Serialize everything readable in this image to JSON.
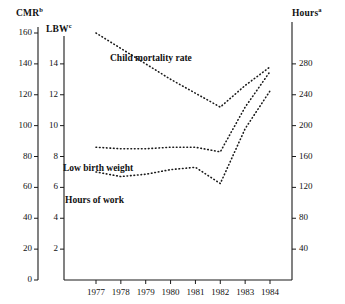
{
  "chart_data": {
    "type": "line",
    "title": "",
    "xlabel": "",
    "x": [
      1977,
      1978,
      1979,
      1980,
      1981,
      1982,
      1983,
      1984
    ],
    "xtick_labels": [
      "1977",
      "1978",
      "1979",
      "1980",
      "1981",
      "1982",
      "1983",
      "1984"
    ],
    "grid": false,
    "legend_position": "inline-annotations",
    "axes": {
      "cmr": {
        "label": "CMR",
        "label_superscript": "b",
        "ticks": [
          0,
          20,
          40,
          60,
          80,
          100,
          120,
          140,
          160
        ],
        "tick_labels": [
          "0",
          "20",
          "40",
          "60",
          "80",
          "100",
          "120",
          "140",
          "160"
        ],
        "ylim": [
          0,
          160
        ],
        "position": "left-outer"
      },
      "lbw": {
        "label": "LBW",
        "label_superscript": "c",
        "ticks": [
          2,
          4,
          6,
          8,
          10,
          12,
          14
        ],
        "tick_labels": [
          "2",
          "4",
          "6",
          "8",
          "10",
          "12",
          "14"
        ],
        "ylim": [
          0,
          16
        ],
        "position": "left-inner"
      },
      "hours": {
        "label": "Hours",
        "label_superscript": "a",
        "ticks": [
          40,
          80,
          120,
          160,
          200,
          240,
          280
        ],
        "tick_labels": [
          "40",
          "80",
          "120",
          "160",
          "200",
          "240",
          "280"
        ],
        "ylim": [
          0,
          320
        ],
        "position": "right"
      }
    },
    "series": [
      {
        "name": "Child mortality rate",
        "axis": "cmr",
        "style": "dotted",
        "values": [
          160,
          150,
          140,
          130,
          121,
          112,
          126,
          138
        ]
      },
      {
        "name": "Low birth weight",
        "axis": "lbw",
        "style": "dotted",
        "values": [
          8.6,
          8.5,
          8.5,
          8.6,
          8.6,
          8.3,
          11.2,
          13.5
        ]
      },
      {
        "name": "Hours of work",
        "axis": "hours",
        "style": "dotted",
        "values": [
          140,
          134,
          137,
          143,
          146,
          125,
          196,
          245
        ]
      }
    ]
  },
  "annotations": {
    "child_mortality": "Child mortality rate",
    "low_birth_weight": "Low birth weight",
    "hours_of_work": "Hours of work"
  },
  "colors": {
    "axis": "#1a1a1a",
    "series": "#1a1a1a",
    "background": "#ffffff"
  }
}
